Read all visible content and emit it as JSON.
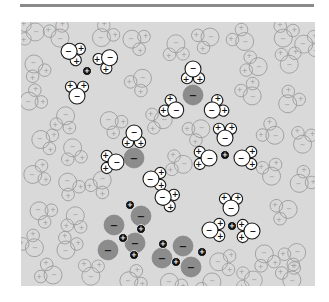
{
  "figure": {
    "symbols": {
      "positive": "+",
      "negative": "−"
    },
    "colors": {
      "panel": "#d9d9d9",
      "rule": "#8a8a8a",
      "anion": "#8c8c8c",
      "cation": "#111111",
      "water_fill": "#ffffff",
      "ghost_stroke": "#9a9a9a"
    }
  },
  "hydrated_ions": [
    {
      "ion": "cation",
      "charge": "+",
      "x": 66,
      "y": 49,
      "waters": [
        {
          "x": 50,
          "y": 30,
          "rot": 200
        },
        {
          "x": 87,
          "y": 37,
          "rot": 320
        },
        {
          "x": 56,
          "y": 72,
          "rot": 90
        }
      ]
    },
    {
      "ion": "anion",
      "charge": "−",
      "x": 172,
      "y": 73,
      "waters": [
        {
          "x": 172,
          "y": 49,
          "rot": 270
        },
        {
          "x": 153,
          "y": 87,
          "rot": 30
        },
        {
          "x": 193,
          "y": 87,
          "rot": 150
        }
      ]
    },
    {
      "ion": "anion",
      "charge": "−",
      "x": 113,
      "y": 136,
      "waters": [
        {
          "x": 113,
          "y": 113,
          "rot": 270
        },
        {
          "x": 93,
          "y": 140,
          "rot": 0
        },
        {
          "x": 132,
          "y": 157,
          "rot": 180
        }
      ]
    },
    {
      "ion": "cation",
      "charge": "+",
      "x": 204,
      "y": 133,
      "waters": [
        {
          "x": 204,
          "y": 114,
          "rot": 90
        },
        {
          "x": 186,
          "y": 136,
          "rot": 0
        },
        {
          "x": 223,
          "y": 136,
          "rot": 180
        }
      ]
    },
    {
      "ion": "cation",
      "charge": "+",
      "x": 211,
      "y": 204,
      "waters": [
        {
          "x": 210,
          "y": 184,
          "rot": 90
        },
        {
          "x": 191,
          "y": 208,
          "rot": 180
        },
        {
          "x": 229,
          "y": 209,
          "rot": 0
        }
      ]
    }
  ],
  "lone_waters": [
    {
      "x": 144,
      "y": 176,
      "rot": 200
    }
  ],
  "crystal": {
    "anions": [
      {
        "x": 120,
        "y": 194
      },
      {
        "x": 93,
        "y": 203
      },
      {
        "x": 114,
        "y": 221
      },
      {
        "x": 87,
        "y": 228
      },
      {
        "x": 141,
        "y": 236
      },
      {
        "x": 162,
        "y": 224
      },
      {
        "x": 170,
        "y": 245
      }
    ],
    "cations": [
      {
        "x": 109,
        "y": 183
      },
      {
        "x": 120,
        "y": 207
      },
      {
        "x": 102,
        "y": 216
      },
      {
        "x": 142,
        "y": 222
      },
      {
        "x": 113,
        "y": 233
      },
      {
        "x": 155,
        "y": 240
      },
      {
        "x": 181,
        "y": 230
      }
    ]
  },
  "background_waters": [
    {
      "x": 12,
      "y": 10
    },
    {
      "x": 38,
      "y": 14
    },
    {
      "x": 82,
      "y": 14
    },
    {
      "x": 113,
      "y": 18
    },
    {
      "x": 155,
      "y": 24
    },
    {
      "x": 187,
      "y": 16
    },
    {
      "x": 222,
      "y": 18
    },
    {
      "x": 263,
      "y": 14
    },
    {
      "x": 285,
      "y": 22
    },
    {
      "x": 14,
      "y": 44
    },
    {
      "x": 120,
      "y": 58
    },
    {
      "x": 235,
      "y": 44
    },
    {
      "x": 268,
      "y": 40
    },
    {
      "x": 10,
      "y": 78
    },
    {
      "x": 90,
      "y": 100
    },
    {
      "x": 44,
      "y": 96
    },
    {
      "x": 140,
      "y": 98
    },
    {
      "x": 230,
      "y": 72
    },
    {
      "x": 268,
      "y": 80
    },
    {
      "x": 22,
      "y": 118
    },
    {
      "x": 52,
      "y": 128
    },
    {
      "x": 178,
      "y": 108
    },
    {
      "x": 252,
      "y": 112
    },
    {
      "x": 282,
      "y": 120
    },
    {
      "x": 14,
      "y": 152
    },
    {
      "x": 48,
      "y": 162
    },
    {
      "x": 80,
      "y": 160
    },
    {
      "x": 160,
      "y": 142
    },
    {
      "x": 250,
      "y": 152
    },
    {
      "x": 280,
      "y": 160
    },
    {
      "x": 20,
      "y": 190
    },
    {
      "x": 54,
      "y": 196
    },
    {
      "x": 265,
      "y": 188
    },
    {
      "x": 12,
      "y": 224
    },
    {
      "x": 46,
      "y": 226
    },
    {
      "x": 200,
      "y": 240
    },
    {
      "x": 244,
      "y": 234
    },
    {
      "x": 274,
      "y": 232
    },
    {
      "x": 30,
      "y": 252
    },
    {
      "x": 70,
      "y": 252
    },
    {
      "x": 110,
      "y": 258
    },
    {
      "x": 150,
      "y": 262
    },
    {
      "x": 190,
      "y": 262
    },
    {
      "x": 230,
      "y": 258
    },
    {
      "x": 270,
      "y": 256
    }
  ]
}
